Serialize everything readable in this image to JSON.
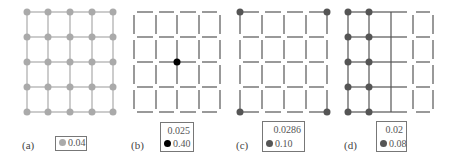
{
  "panels": [
    {
      "label": "(a)",
      "legend": {
        "top_value": "",
        "dot_value": "0.04",
        "dot_color": "#aaaaaa"
      },
      "grid": {
        "x": [
          27,
          48,
          70,
          92,
          113
        ],
        "y": [
          12,
          37,
          62,
          87,
          112
        ],
        "line_style": "solid",
        "line_color": "#aaaaaa"
      },
      "nodes": "all"
    },
    {
      "label": "(b)",
      "legend": {
        "top_value": "0.025",
        "dot_value": "0.40",
        "dot_color": "#000000"
      },
      "grid": {
        "x": [
          134,
          156,
          177,
          199,
          220
        ],
        "y": [
          12,
          37,
          62,
          87,
          112
        ],
        "line_style": "broken",
        "line_color": "#555555"
      },
      "nodes": "center"
    },
    {
      "label": "(c)",
      "legend": {
        "top_value": "0.0286",
        "dot_value": "0.10",
        "dot_color": "#555555"
      },
      "grid": {
        "x": [
          240,
          262,
          284,
          306,
          327
        ],
        "y": [
          12,
          37,
          62,
          87,
          112
        ],
        "line_style": "broken",
        "line_color": "#555555"
      },
      "nodes": "corners"
    },
    {
      "label": "(d)",
      "legend": {
        "top_value": "0.02",
        "dot_value": "0.08",
        "dot_color": "#555555"
      },
      "grid": {
        "x": [
          348,
          369,
          391,
          413,
          433
        ],
        "y": [
          12,
          37,
          62,
          87,
          112
        ],
        "line_style": "mixed",
        "line_color": "#555555"
      },
      "nodes": "left-two-columns"
    }
  ]
}
